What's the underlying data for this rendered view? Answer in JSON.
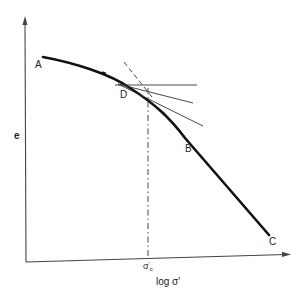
{
  "diagram": {
    "type": "casagrande-construction",
    "y_axis_label": "e",
    "x_axis_label": "log σ′",
    "x_tick_label": "σ′c",
    "points": {
      "A": "A",
      "B": "B",
      "C": "C",
      "D": "D"
    },
    "colors": {
      "curve": "#111111",
      "axes": "#333333",
      "construction": "#333333"
    }
  }
}
